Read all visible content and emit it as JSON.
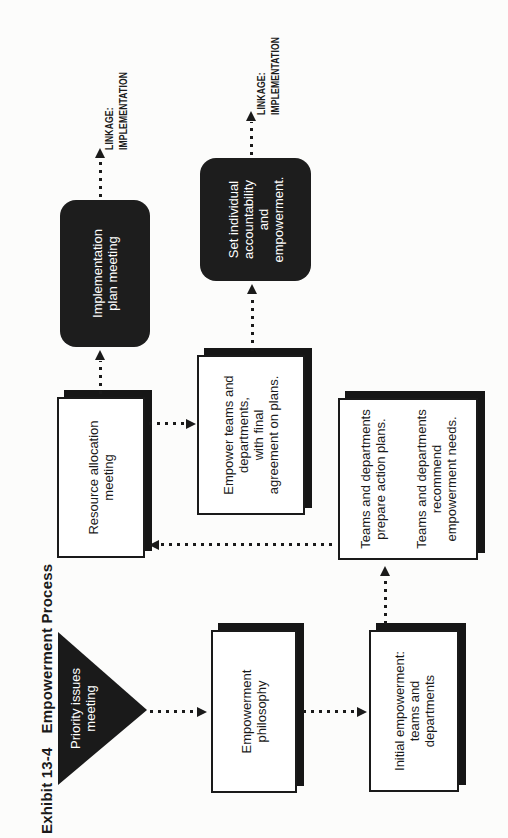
{
  "page": {
    "background": "#fcfcfb",
    "ink_color": "#1a1a1a",
    "node_fill": "#1d1d1d",
    "orientation": "rotated-90-ccw"
  },
  "title": {
    "exhibit_number": "Exhibit 13-4",
    "exhibit_name": "Empowerment Process"
  },
  "nodes": {
    "priority": {
      "shape": "triangle-down",
      "lines": [
        "Priority issues",
        "meeting"
      ]
    },
    "philosophy": {
      "shape": "rect",
      "lines": [
        "Empowerment",
        "philosophy"
      ]
    },
    "initial": {
      "shape": "rect",
      "lines": [
        "Initial empowerment:",
        "teams and",
        "departments"
      ]
    },
    "resource": {
      "shape": "rect",
      "lines": [
        "Resource allocation",
        "meeting"
      ]
    },
    "empower": {
      "shape": "rect",
      "lines": [
        "Empower teams and",
        "departments,",
        "with final",
        "agreement on plans."
      ]
    },
    "teams": {
      "shape": "rect",
      "para1": [
        "Teams and departments",
        "prepare action plans."
      ],
      "para2": [
        "Teams and departments",
        "recommend",
        "empowerment needs."
      ]
    },
    "implementation": {
      "shape": "rounded-black",
      "lines": [
        "Implementation",
        "plan meeting"
      ]
    },
    "accountability": {
      "shape": "rounded-black",
      "lines": [
        "Set individual",
        "accountability",
        "and",
        "empowerment."
      ]
    }
  },
  "linkage1": {
    "line1": "LINKAGE:",
    "line2": "IMPLEMENTATION"
  },
  "linkage2": {
    "line1": "LINKAGE:",
    "line2": "IMPLEMENTATION"
  },
  "connections": [
    "priority -> philosophy",
    "philosophy -> initial",
    "initial -> teams",
    "teams -> resource",
    "resource -> empower",
    "resource -> implementation",
    "empower -> accountability",
    "implementation -> linkage-implementation",
    "accountability -> linkage-implementation"
  ]
}
